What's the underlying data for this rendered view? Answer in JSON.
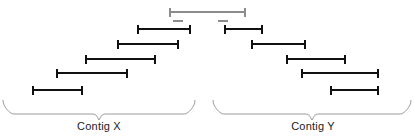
{
  "figure": {
    "type": "sequence-assembly-contig-diagram",
    "width": 414,
    "height": 138,
    "background_color": "#ffffff"
  },
  "colors": {
    "read_black": "#111111",
    "read_gray": "#8c8c8c",
    "brace_gray": "#9a9a9a",
    "label_text": "#1a1a1a"
  },
  "reads": [
    {
      "id": "read-span-1",
      "row": 1,
      "group": "spanning",
      "color_key": "read_gray",
      "x_start": 170,
      "x_end": 245,
      "y": 12,
      "thickness": 2.6,
      "cap_height": 9
    },
    {
      "id": "read-x-1",
      "row": 2,
      "group": "contig_x",
      "color_key": "read_black",
      "x_start": 138,
      "x_end": 190,
      "y": 29,
      "thickness": 2.6,
      "cap_height": 9
    },
    {
      "id": "read-y-1",
      "row": 2,
      "group": "contig_y",
      "color_key": "read_black",
      "x_start": 225,
      "x_end": 262,
      "y": 29,
      "thickness": 2.6,
      "cap_height": 9
    },
    {
      "id": "read-x-2",
      "row": 3,
      "group": "contig_x",
      "color_key": "read_black",
      "x_start": 118,
      "x_end": 178,
      "y": 44,
      "thickness": 2.6,
      "cap_height": 9
    },
    {
      "id": "read-y-2",
      "row": 3,
      "group": "contig_y",
      "color_key": "read_black",
      "x_start": 252,
      "x_end": 305,
      "y": 44,
      "thickness": 2.6,
      "cap_height": 9
    },
    {
      "id": "read-x-3",
      "row": 4,
      "group": "contig_x",
      "color_key": "read_black",
      "x_start": 86,
      "x_end": 155,
      "y": 59,
      "thickness": 2.6,
      "cap_height": 9
    },
    {
      "id": "read-y-3",
      "row": 4,
      "group": "contig_y",
      "color_key": "read_black",
      "x_start": 287,
      "x_end": 345,
      "y": 59,
      "thickness": 2.6,
      "cap_height": 9
    },
    {
      "id": "read-x-4",
      "row": 5,
      "group": "contig_x",
      "color_key": "read_black",
      "x_start": 57,
      "x_end": 127,
      "y": 73,
      "thickness": 2.6,
      "cap_height": 9
    },
    {
      "id": "read-y-4",
      "row": 5,
      "group": "contig_y",
      "color_key": "read_black",
      "x_start": 302,
      "x_end": 378,
      "y": 73,
      "thickness": 2.6,
      "cap_height": 9
    },
    {
      "id": "read-x-5",
      "row": 6,
      "group": "contig_x",
      "color_key": "read_black",
      "x_start": 33,
      "x_end": 82,
      "y": 90,
      "thickness": 2.6,
      "cap_height": 9
    },
    {
      "id": "read-y-5",
      "row": 6,
      "group": "contig_y",
      "color_key": "read_black",
      "x_start": 331,
      "x_end": 378,
      "y": 90,
      "thickness": 2.6,
      "cap_height": 9
    }
  ],
  "gap_marks": [
    {
      "id": "gap-mark-left",
      "color_key": "read_gray",
      "x_start": 173,
      "x_end": 183,
      "y": 21,
      "thickness": 2.2
    },
    {
      "id": "gap-mark-right",
      "color_key": "read_gray",
      "x_start": 218,
      "x_end": 228,
      "y": 21,
      "thickness": 2.2
    }
  ],
  "braces": [
    {
      "id": "brace-contig-x",
      "x_start": 3,
      "x_end": 195,
      "y_top": 100,
      "y_bottom": 117,
      "color_key": "brace_gray"
    },
    {
      "id": "brace-contig-y",
      "x_start": 213,
      "x_end": 411,
      "y_top": 100,
      "y_bottom": 117,
      "color_key": "brace_gray"
    }
  ],
  "labels": [
    {
      "id": "label-contig-x",
      "text": "Contig X",
      "x": 99,
      "y": 120
    },
    {
      "id": "label-contig-y",
      "text": "Contig Y",
      "x": 313,
      "y": 120
    }
  ]
}
